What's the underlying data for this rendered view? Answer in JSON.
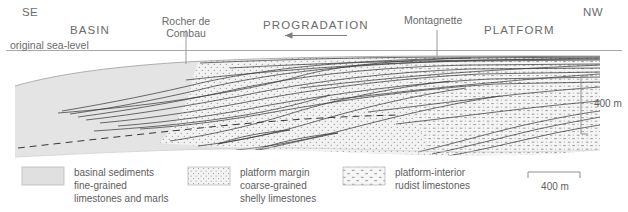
{
  "figure": {
    "type": "geological-cross-section",
    "orientation": {
      "left_label": "SE",
      "right_label": "NW"
    },
    "annotations": {
      "basin": "BASIN",
      "platform": "PLATFORM",
      "progradation": "PROGRADATION",
      "progradation_direction": "left",
      "sea_level": "original sea-level",
      "locality_1": "Rocher de\nCombau",
      "locality_1_line1": "Rocher de",
      "locality_1_line2": "Combau",
      "locality_2": "Montagnette"
    },
    "scales": {
      "vertical": "400 m",
      "horizontal": "400 m"
    },
    "colors": {
      "basinal_fill": "#e3e3e3",
      "margin_fill": "#f0f0f0",
      "interior_fill": "#f4f4f4",
      "line": "#3a3a3a",
      "text": "#6b6b6b",
      "sea_level_line": "#9a9a9a"
    }
  },
  "legend": {
    "items": [
      {
        "pattern": "solid-gray",
        "line1": "basinal sediments",
        "line2": "fine-grained",
        "line3": "limestones and marls"
      },
      {
        "pattern": "stipple-dots",
        "line1": "platform margin",
        "line2": "coarse-grained",
        "line3": "shelly limestones"
      },
      {
        "pattern": "rudist-dashes",
        "line1": "platform-interior",
        "line2": "rudist limestones",
        "line3": ""
      }
    ],
    "scalebar_label": "400 m"
  }
}
